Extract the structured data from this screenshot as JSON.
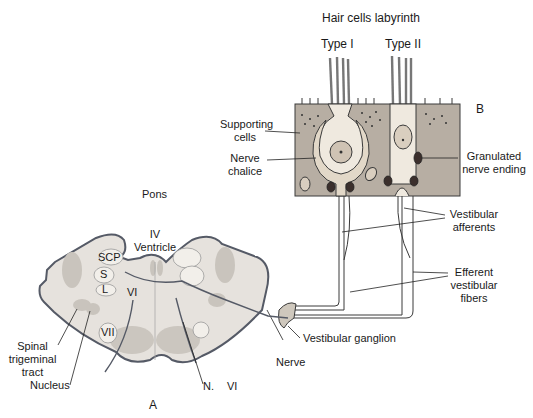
{
  "diagram": {
    "panel_b": {
      "title": "Hair cells labyrinth",
      "panel_letter": "B",
      "type_i_label": "Type I",
      "type_ii_label": "Type II",
      "supporting_cells_label": [
        "Supporting",
        "cells"
      ],
      "nerve_chalice_label": [
        "Nerve",
        "chalice"
      ],
      "granulated_label": [
        "Granulated",
        "nerve ending"
      ]
    },
    "pathway": {
      "vestibular_afferents": [
        "Vestibular",
        "afferents"
      ],
      "efferent_fibers": [
        "Efferent",
        "vestibular",
        "fibers"
      ],
      "vestibular_ganglion": "Vestibular ganglion",
      "nerve": "Nerve"
    },
    "panel_a": {
      "title": "Pons",
      "panel_letter": "A",
      "iv_ventricle": [
        "IV",
        "Ventricle"
      ],
      "scp": "SCP",
      "s": "S",
      "l": "L",
      "vi_nucleus": "VI",
      "vii": "VII",
      "spinal_trigeminal": [
        "Spinal",
        "trigeminal",
        "tract"
      ],
      "nucleus": "Nucleus",
      "n_vi": [
        "N.",
        "VI"
      ]
    },
    "colors": {
      "tissue_fill": "#ddd6cc",
      "supporting_cell_fill": "#b7aea3",
      "hair_cell_fill": "#efe9df",
      "nerve_ending_fill": "#3b2f2c",
      "outline": "#3a3a3a",
      "pons_fill": "#e6e2dd",
      "pons_outline": "#555a66"
    }
  }
}
